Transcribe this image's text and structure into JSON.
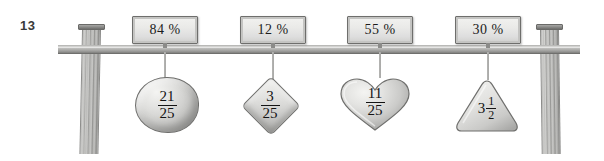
{
  "exercise": {
    "number": "13"
  },
  "colors": {
    "background": "#ffffff",
    "bar": "#b4b4b2",
    "post": "#c2c2c0",
    "plaque_fill": "#eaeae8",
    "ink": "#141414"
  },
  "balance": {
    "left_post": "wooden-post",
    "right_post": "wooden-post",
    "bar": "horizontal-bar"
  },
  "hangers": [
    {
      "percent_label": "84 %",
      "shape": "oval",
      "value_type": "fraction",
      "numerator": "21",
      "denominator": "25"
    },
    {
      "percent_label": "12 %",
      "shape": "diamond",
      "value_type": "fraction",
      "numerator": "3",
      "denominator": "25"
    },
    {
      "percent_label": "55 %",
      "shape": "heart",
      "value_type": "fraction",
      "numerator": "11",
      "denominator": "25"
    },
    {
      "percent_label": "30 %",
      "shape": "triangle",
      "value_type": "mixed-number",
      "whole": "3",
      "numerator": "1",
      "denominator": "2"
    }
  ]
}
